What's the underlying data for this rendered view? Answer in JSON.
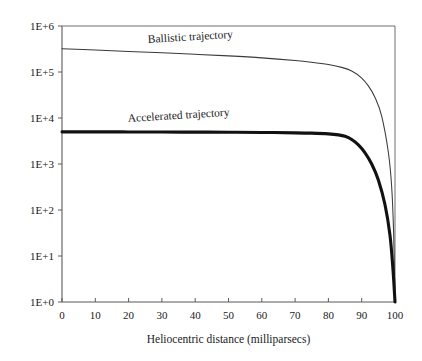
{
  "chart_data": {
    "type": "line",
    "title": "",
    "xlabel": "Heliocentric distance (milliparsecs)",
    "ylabel": "",
    "xlim": [
      0,
      100
    ],
    "ylim": [
      1,
      1000000
    ],
    "yscale": "log",
    "xscale": "linear",
    "grid": false,
    "legend_position": "inline-annotation",
    "xticks": [
      0,
      10,
      20,
      30,
      40,
      50,
      60,
      70,
      80,
      90,
      100
    ],
    "xtick_labels": [
      "0",
      "10",
      "20",
      "30",
      "40",
      "50",
      "60",
      "70",
      "80",
      "90",
      "100"
    ],
    "yticks": [
      1,
      10,
      100,
      1000,
      10000,
      100000,
      1000000
    ],
    "ytick_labels": [
      "1E+0",
      "1E+1",
      "1E+2",
      "1E+3",
      "1E+4",
      "1E+5",
      "1E+6"
    ],
    "series": [
      {
        "name": "Ballistic trajectory",
        "label": "Ballistic trajectory",
        "style": "thin",
        "x": [
          0,
          10,
          20,
          30,
          40,
          50,
          60,
          70,
          75,
          80,
          84,
          87,
          90,
          92,
          94,
          96,
          98,
          99,
          99.6,
          100
        ],
        "values": [
          320000,
          300000,
          280000,
          262000,
          243000,
          224000,
          203000,
          178000,
          163000,
          145000,
          126000,
          105000,
          74000,
          50000,
          28000,
          11000,
          1800,
          320,
          30,
          1
        ]
      },
      {
        "name": "Accelerated trajectory",
        "label": "Accelerated trajectory",
        "style": "thick",
        "x": [
          0,
          10,
          20,
          30,
          40,
          50,
          60,
          70,
          75,
          80,
          83,
          85,
          87,
          89,
          91,
          93,
          95,
          97,
          98.5,
          99.4,
          100
        ],
        "values": [
          5000,
          5000,
          4980,
          4960,
          4930,
          4900,
          4850,
          4760,
          4680,
          4520,
          4300,
          4000,
          3400,
          2600,
          1750,
          1000,
          450,
          130,
          28,
          5,
          1
        ]
      }
    ],
    "annotations": [
      {
        "text": "Ballistic trajectory",
        "x_px": 148,
        "y_px": 43,
        "rotation": -3.5
      },
      {
        "text": "Accelerated trajectory",
        "x_px": 128,
        "y_px": 122,
        "rotation": -3.5
      }
    ],
    "colors": {
      "background": "#ffffff",
      "ballistic_line": "#3a3a3a",
      "accelerated_line": "#111111",
      "axis": "#5a5a5a",
      "frame": "#6f6f6f",
      "text": "#1a1a1a"
    },
    "plot_area_px": {
      "left": 62,
      "right": 395,
      "top": 26,
      "bottom": 302
    }
  }
}
